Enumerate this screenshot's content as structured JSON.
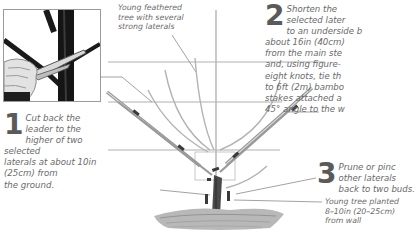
{
  "figure": {
    "colors": {
      "text": "#6a6a6a",
      "step_number": "#5a5a5a",
      "wire": "#9e9e9e",
      "cane": "#a8a8a8",
      "trunk": "#4a4a4a",
      "soil": "#8a8a8a"
    }
  },
  "captions": {
    "top": [
      "Young feathered",
      "tree with several",
      "strong laterals"
    ],
    "bottom": [
      "Young tree planted",
      "8–10in (20–25cm)",
      "from wall"
    ]
  },
  "steps": [
    {
      "number": "1",
      "lines": [
        "Cut back the",
        "leader to the",
        "higher of two selected",
        "laterals at about 10in",
        "(25cm) from",
        "the ground."
      ]
    },
    {
      "number": "2",
      "lines": [
        "Shorten the",
        "selected later",
        "to an underside b",
        "about 16in (40cm)",
        "from the main ste",
        "and, using figure-",
        "eight knots, tie th",
        "to 6ft (2m) bambo",
        "stakes attached a",
        "45° angle to the w"
      ]
    },
    {
      "number": "3",
      "lines": [
        "Prune or pinc",
        "other laterals",
        "back to two buds."
      ]
    }
  ],
  "inset_photo": {
    "description": "hand-with-secateurs-cutting-leader"
  }
}
